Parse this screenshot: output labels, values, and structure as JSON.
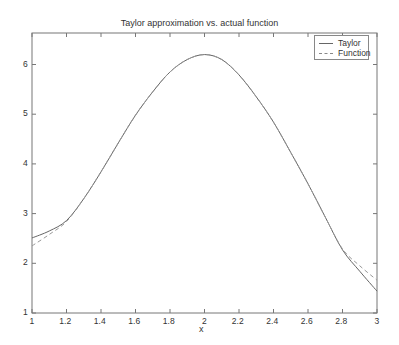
{
  "chart_data": {
    "type": "line",
    "title": "Taylor approximation vs. actual function",
    "xlabel": "x",
    "ylabel": "",
    "xlim": [
      1,
      3
    ],
    "ylim": [
      1,
      6.6
    ],
    "xticks": [
      "1",
      "1.2",
      "1.4",
      "1.6",
      "1.8",
      "2",
      "2.2",
      "2.4",
      "2.6",
      "2.8",
      "3"
    ],
    "yticks": [
      "1",
      "2",
      "3",
      "4",
      "5",
      "6"
    ],
    "grid": false,
    "legend_position": "upper right",
    "x": [
      1.0,
      1.1,
      1.2,
      1.3,
      1.4,
      1.5,
      1.6,
      1.7,
      1.8,
      1.9,
      2.0,
      2.1,
      2.2,
      2.3,
      2.4,
      2.5,
      2.6,
      2.7,
      2.8,
      2.9,
      3.0
    ],
    "series": [
      {
        "name": "Taylor",
        "style": "solid",
        "values": [
          2.51,
          2.65,
          2.86,
          3.3,
          3.84,
          4.42,
          4.98,
          5.45,
          5.85,
          6.1,
          6.2,
          6.1,
          5.79,
          5.35,
          4.84,
          4.23,
          3.6,
          2.93,
          2.27,
          1.84,
          1.44
        ]
      },
      {
        "name": "Function",
        "style": "dashed",
        "values": [
          2.35,
          2.58,
          2.84,
          3.3,
          3.84,
          4.42,
          4.98,
          5.45,
          5.85,
          6.1,
          6.2,
          6.1,
          5.79,
          5.35,
          4.84,
          4.23,
          3.6,
          2.93,
          2.29,
          1.95,
          1.66
        ]
      }
    ]
  },
  "legend": {
    "items": [
      {
        "label": "Taylor"
      },
      {
        "label": "Function"
      }
    ]
  }
}
